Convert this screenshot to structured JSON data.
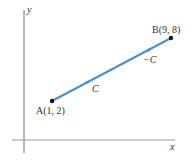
{
  "diagram": {
    "axes": {
      "x_label": "x",
      "y_label": "y",
      "axis_color": "#777777"
    },
    "segment": {
      "color": "#4a90c8",
      "start": {
        "name": "A",
        "coords": "(1, 2)",
        "label": "A(1, 2)"
      },
      "end": {
        "name": "B",
        "coords": "(9, 8)",
        "label": "B(9, 8)"
      }
    },
    "curve_labels": {
      "forward": "C",
      "reverse": "−C"
    }
  }
}
